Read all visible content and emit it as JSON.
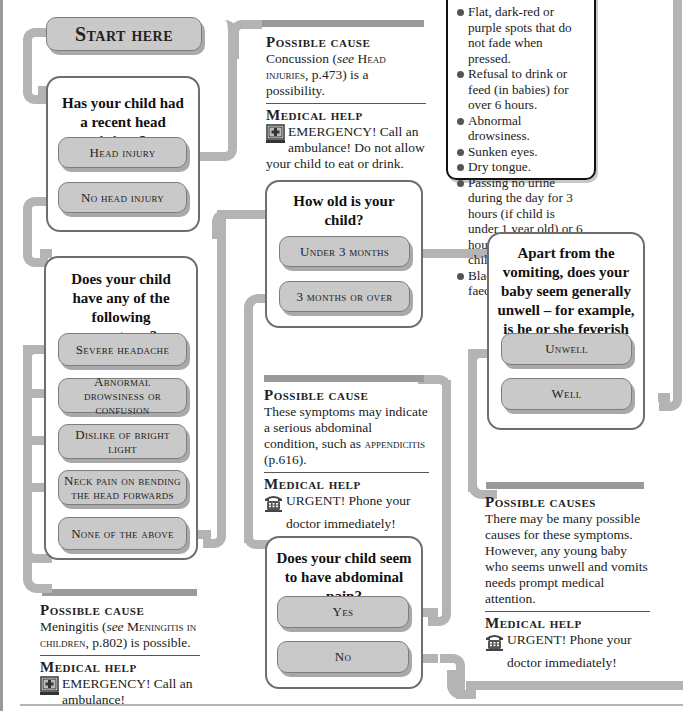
{
  "start": {
    "label": "Start here"
  },
  "q1": {
    "question": "Has your child had a recent head injury?",
    "options": [
      "Head injury",
      "No head injury"
    ]
  },
  "cause_head": {
    "title": "Possible cause",
    "body_pre": "Concussion (",
    "body_see": "see",
    "body_ref": " Head injuries",
    "body_post": ", p.473) is a possibility.",
    "help_title": "Medical help",
    "help_text": "EMERGENCY! Call an ambulance! Do not allow your child to eat or drink.",
    "icon": "emergency-ambulance-icon"
  },
  "symptoms_box": {
    "items": [
      "Flat, dark-red or purple spots that do not fade when pressed.",
      "Refusal to drink or feed (in babies) for over 6 hours.",
      "Abnormal drowsiness.",
      "Sunken eyes.",
      "Dry tongue.",
      "Passing no urine during the day for 3 hours (if child is under 1 year old) or 6 hours (in an older child).",
      "Black or bloodstained faeces."
    ]
  },
  "q2": {
    "question": "Does your child have any of the following symptoms?",
    "options": [
      "Severe headache",
      "Abnormal drowsiness or confusion",
      "Dislike of bright light",
      "Neck pain on bending the head forwards",
      "None of the above"
    ]
  },
  "cause_meningitis": {
    "title": "Possible cause",
    "body_pre": "Meningitis (",
    "body_see": "see",
    "body_ref": " Meningitis in children",
    "body_post": ", p.802) is possible.",
    "help_title": "Medical help",
    "help_text": "EMERGENCY! Call an ambulance!",
    "icon": "emergency-ambulance-icon"
  },
  "q3": {
    "question": "How old is your child?",
    "options": [
      "Under 3 months",
      "3 months or over"
    ]
  },
  "cause_abdominal": {
    "title": "Possible cause",
    "body_pre": "These symptoms may indicate a serious abdominal condition, such as ",
    "body_ref": "appendicitis",
    "body_post": " (p.616).",
    "help_title": "Medical help",
    "help_text": "URGENT! Phone your doctor immediately!",
    "icon": "telephone-icon"
  },
  "q4": {
    "question": "Does your child seem to have abdominal pain?",
    "options": [
      "Yes",
      "No"
    ]
  },
  "q5": {
    "question": "Apart from the vomiting, does your baby seem generally unwell – for example, is he or she feverish or drowsy?",
    "options": [
      "Unwell",
      "Well"
    ]
  },
  "cause_baby": {
    "title": "Possible causes",
    "body": "There may be many possible causes for these symptoms. However, any young baby who seems unwell and vomits needs prompt medical attention.",
    "help_title": "Medical help",
    "help_text": "URGENT! Phone your doctor immediately!",
    "icon": "telephone-icon"
  },
  "colors": {
    "pipe": "#b4b4b4",
    "button_fill": "#c9c9c9",
    "button_border": "#7d7d7d",
    "box_border": "#6e6e6e",
    "text": "#1a1a1a"
  }
}
